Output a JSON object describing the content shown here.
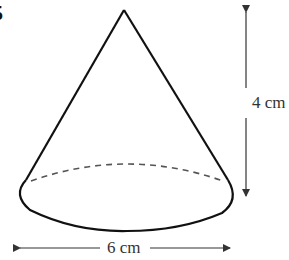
{
  "question_number": "5",
  "shape": "cone",
  "dimensions": {
    "height": {
      "value": 4,
      "unit": "cm",
      "label": "4 cm"
    },
    "base_diameter": {
      "value": 6,
      "unit": "cm",
      "label": "6 cm"
    }
  },
  "style": {
    "outline_color": "#111111",
    "arrow_color": "#333333",
    "hidden_edge": "dashed"
  }
}
